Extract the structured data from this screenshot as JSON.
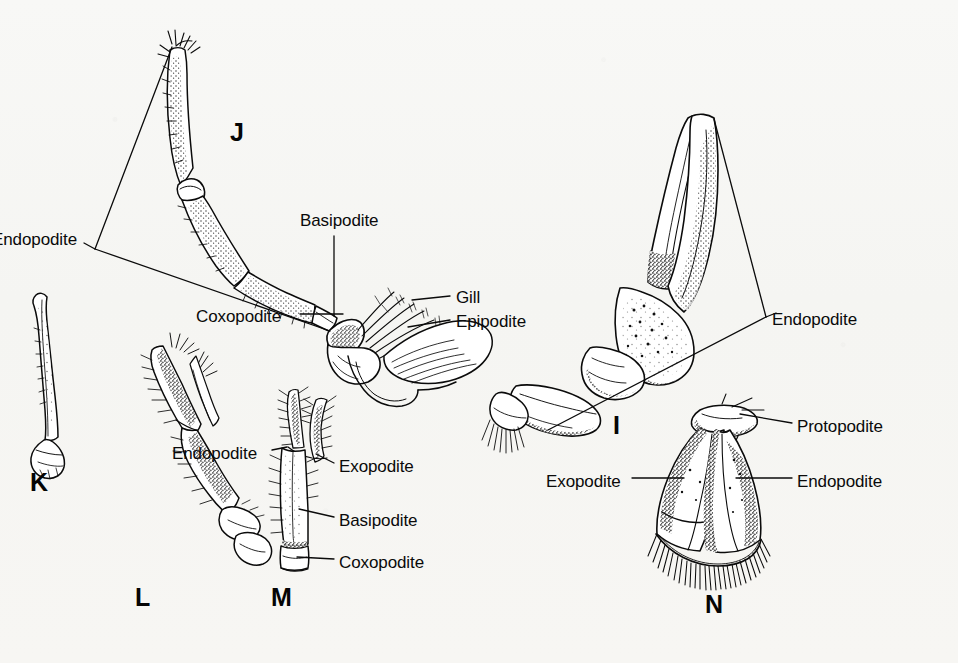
{
  "plate": {
    "title": "Crustacean appendages comparative plate",
    "background_color": "#f7f7f5",
    "ink_color": "#0a0a0a",
    "width": 958,
    "height": 663
  },
  "figure_letters": [
    {
      "name": "figure-letter-j",
      "text": "J",
      "x": 230,
      "y": 120
    },
    {
      "name": "figure-letter-k",
      "text": "K",
      "x": 30,
      "y": 470
    },
    {
      "name": "figure-letter-l",
      "text": "L",
      "x": 135,
      "y": 585
    },
    {
      "name": "figure-letter-m",
      "text": "M",
      "x": 271,
      "y": 585
    },
    {
      "name": "figure-letter-i",
      "text": "I",
      "x": 613,
      "y": 413
    },
    {
      "name": "figure-letter-n",
      "text": "N",
      "x": 705,
      "y": 592
    }
  ],
  "labels": [
    {
      "name": "label-endopodite-j",
      "text": "Endopodite",
      "x": 0,
      "y": 231,
      "align": "left",
      "clipped": true
    },
    {
      "name": "label-basipodite-j",
      "text": "Basipodite",
      "x": 300,
      "y": 212,
      "align": "left"
    },
    {
      "name": "label-coxopodite-j",
      "text": "Coxopodite",
      "x": 196,
      "y": 308,
      "align": "left"
    },
    {
      "name": "label-gill-j",
      "text": "Gill",
      "x": 456,
      "y": 289,
      "align": "left"
    },
    {
      "name": "label-epipodite-j",
      "text": "Epipodite",
      "x": 456,
      "y": 313,
      "align": "left"
    },
    {
      "name": "label-endopodite-i",
      "text": "Endopodite",
      "x": 772,
      "y": 311,
      "align": "left"
    },
    {
      "name": "label-endopodite-m",
      "text": "Endopodite",
      "x": 172,
      "y": 445,
      "align": "left"
    },
    {
      "name": "label-exopodite-m",
      "text": "Exopodite",
      "x": 339,
      "y": 458,
      "align": "left"
    },
    {
      "name": "label-basipodite-m",
      "text": "Basipodite",
      "x": 339,
      "y": 512,
      "align": "left"
    },
    {
      "name": "label-coxopodite-m",
      "text": "Coxopodite",
      "x": 339,
      "y": 554,
      "align": "left"
    },
    {
      "name": "label-exopodite-n",
      "text": "Exopodite",
      "x": 546,
      "y": 473,
      "align": "left"
    },
    {
      "name": "label-protopodite-n",
      "text": "Protopodite",
      "x": 797,
      "y": 418,
      "align": "left"
    },
    {
      "name": "label-endopodite-n",
      "text": "Endopodite",
      "x": 797,
      "y": 473,
      "align": "left"
    }
  ],
  "specimens": [
    {
      "name": "specimen-j-walking-leg",
      "letter": "J",
      "description": "walking leg with gill and epipodite"
    },
    {
      "name": "specimen-k-slender-appendage",
      "letter": "K",
      "description": "slender rod-like appendage"
    },
    {
      "name": "specimen-l-maxilliped",
      "letter": "L",
      "description": "setose maxilliped"
    },
    {
      "name": "specimen-m-swimmeret",
      "letter": "M",
      "description": "biramous swimmeret"
    },
    {
      "name": "specimen-i-cheliped",
      "letter": "I",
      "description": "cheliped with large claw"
    },
    {
      "name": "specimen-n-uropod",
      "letter": "N",
      "description": "uropod with fringed plates"
    }
  ]
}
